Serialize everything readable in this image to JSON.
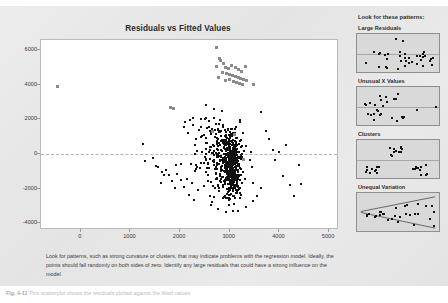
{
  "chart": {
    "title": "Residuals vs Fitted Values",
    "note": "Look for patterns, such as strong curvature or clusters, that may indicate problems with the regression model. Ideally, the points should fall randomly on both sides of zero. Identify any large residuals that could have a strong influence on the model."
  },
  "sidebar": {
    "title": "Look for these patterns:",
    "panels": [
      {
        "label": "Large Residuals"
      },
      {
        "label": "Unusual X Values"
      },
      {
        "label": "Clusters"
      },
      {
        "label": "Unequal Variation"
      }
    ]
  },
  "figure_caption": {
    "number": "Fig. 4-11",
    "text": "This scatterplot shows the residuals plotted against the fitted values."
  },
  "colors": {
    "point": "#111111",
    "highlight_point": "#8a8a8a",
    "background": "#e8e8e8",
    "plot_background": "#ffffff",
    "zero_line": "#b0b0b0"
  },
  "chart_data": {
    "type": "scatter",
    "title": "Residuals vs Fitted Values",
    "xlabel": "",
    "ylabel": "",
    "xlim": [
      -800,
      5200
    ],
    "ylim": [
      -4400,
      6600
    ],
    "xticks": [
      0,
      1000,
      2000,
      3000,
      4000,
      5000
    ],
    "yticks": [
      -4000,
      -2000,
      0,
      2000,
      4000,
      6000
    ],
    "grid": false,
    "legend": null,
    "reference_lines": [
      {
        "axis": "y",
        "value": 0,
        "style": "dashed"
      }
    ],
    "series": [
      {
        "name": "Large residuals (highlighted)",
        "color": "#8a8a8a",
        "marker": "square",
        "points": [
          [
            -500,
            4000
          ],
          [
            2700,
            6230
          ],
          [
            2760,
            5620
          ],
          [
            2790,
            5480
          ],
          [
            2850,
            5330
          ],
          [
            2700,
            5150
          ],
          [
            2880,
            5080
          ],
          [
            2940,
            5010
          ],
          [
            3010,
            5200
          ],
          [
            3080,
            5090
          ],
          [
            3140,
            4960
          ],
          [
            3210,
            4880
          ],
          [
            3280,
            5180
          ],
          [
            2830,
            4820
          ],
          [
            2900,
            4760
          ],
          [
            2960,
            4700
          ],
          [
            3020,
            4640
          ],
          [
            3080,
            4580
          ],
          [
            3140,
            4520
          ],
          [
            3190,
            4460
          ],
          [
            3250,
            4410
          ],
          [
            3300,
            4350
          ],
          [
            2750,
            4500
          ],
          [
            3450,
            4100
          ],
          [
            1780,
            2760
          ],
          [
            1830,
            2740
          ],
          [
            3050,
            4280
          ],
          [
            3110,
            4230
          ],
          [
            3170,
            4180
          ],
          [
            2960,
            4400
          ],
          [
            3230,
            4130
          ],
          [
            2890,
            4340
          ],
          [
            2620,
            1380
          ],
          [
            3060,
            1200
          ],
          [
            3240,
            -230
          ]
        ]
      },
      {
        "name": "Residuals",
        "color": "#111111",
        "marker": "square",
        "density_description": "Dense cluster centered near fitted 2900-3200 spanning residual -3300 to +2500, thinning outward to fitted 1200 and 4500.",
        "n_points": 620,
        "cluster_center_x": 3020,
        "cluster_center_y": -400
      }
    ]
  }
}
